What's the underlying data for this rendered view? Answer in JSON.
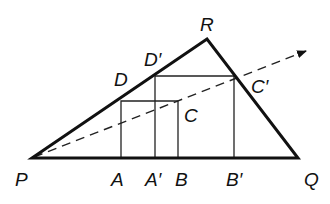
{
  "diagram": {
    "type": "geometry",
    "points": {
      "P": {
        "label": "P",
        "x": 32,
        "y": 158
      },
      "Q": {
        "label": "Q",
        "x": 298,
        "y": 158
      },
      "R": {
        "label": "R",
        "x": 207,
        "y": 39
      },
      "A": {
        "label": "A",
        "x": 121,
        "y": 158
      },
      "B": {
        "label": "B",
        "x": 178,
        "y": 158
      },
      "C": {
        "label": "C",
        "x": 178,
        "y": 101
      },
      "D": {
        "label": "D",
        "x": 121,
        "y": 101
      },
      "A'": {
        "label": "A'",
        "x": 155,
        "y": 158
      },
      "B'": {
        "label": "B'",
        "x": 234,
        "y": 158
      },
      "C'": {
        "label": "C'",
        "x": 234,
        "y": 76
      },
      "D'": {
        "label": "D'",
        "x": 155,
        "y": 76
      }
    },
    "labels": {
      "P": "P",
      "Q": "Q",
      "R": "R",
      "A": "A",
      "B": "B",
      "C": "C",
      "D": "D",
      "A_prime": "A′",
      "B_prime": "B′",
      "C_prime": "C′",
      "D_prime": "D′"
    },
    "triangle": [
      "P",
      "Q",
      "R"
    ],
    "small_square": [
      "A",
      "B",
      "C",
      "D"
    ],
    "large_square": [
      "A'",
      "B'",
      "C'",
      "D'"
    ],
    "ray": {
      "from": "P",
      "through": [
        "C",
        "C'"
      ],
      "style": "dashed",
      "arrow": true,
      "end": {
        "x": 308,
        "y": 50
      }
    },
    "colors": {
      "stroke": "#111111",
      "background": "#ffffff"
    }
  }
}
